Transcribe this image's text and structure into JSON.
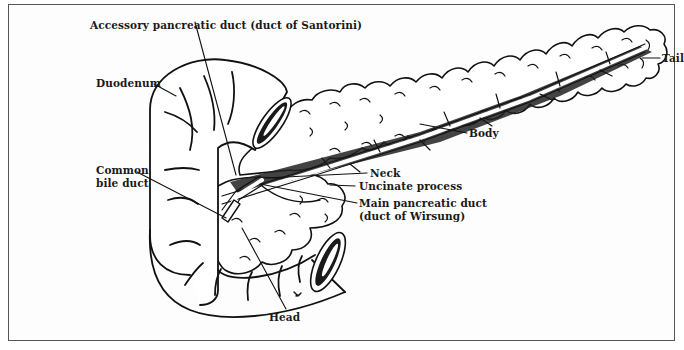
{
  "figure": {
    "line_color": "#111111",
    "frame_color": "#555555",
    "background": "#fdfdfd"
  },
  "labels": {
    "accessory_duct": "Accessory pancreatic duct (duct of Santorini)",
    "duodenum": "Duodenum",
    "common_bile_duct_1": "Common",
    "common_bile_duct_2": "bile duct",
    "tail": "Tail",
    "body": "Body",
    "neck": "Neck",
    "uncinate": "Uncinate process",
    "main_duct_1": "Main pancreatic duct",
    "main_duct_2": "(duct of Wirsung)",
    "head": "Head"
  }
}
